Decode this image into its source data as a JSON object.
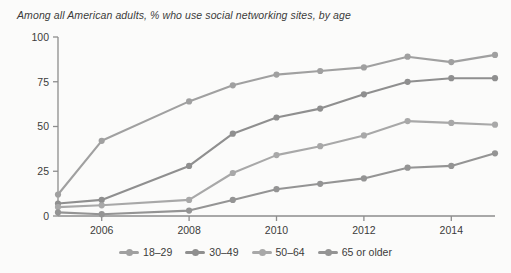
{
  "chart_data": {
    "type": "line",
    "title": "Among all American adults, % who use social networking sites, by age",
    "xlabel": "",
    "ylabel": "",
    "xlim": [
      2005,
      2015
    ],
    "ylim": [
      0,
      100
    ],
    "yticks": [
      0,
      25,
      50,
      75,
      100
    ],
    "ytick_labels": [
      "0",
      "25",
      "50",
      "75",
      "100"
    ],
    "xticks": [
      2006,
      2008,
      2010,
      2012,
      2014
    ],
    "xtick_labels": [
      "2006",
      "2008",
      "2010",
      "2012",
      "2014"
    ],
    "grid": false,
    "legend_position": "bottom",
    "x": [
      2005,
      2006,
      2008,
      2009,
      2010,
      2011,
      2012,
      2013,
      2014,
      2015
    ],
    "series": [
      {
        "name": "18–29",
        "color": "#a0a0a0",
        "values": [
          12,
          42,
          64,
          73,
          79,
          81,
          83,
          89,
          86,
          90
        ]
      },
      {
        "name": "30–49",
        "color": "#8f8f8f",
        "values": [
          7,
          9,
          28,
          46,
          55,
          60,
          68,
          75,
          77,
          77
        ]
      },
      {
        "name": "50–64",
        "color": "#a8a8a8",
        "values": [
          5,
          6,
          9,
          24,
          34,
          39,
          45,
          53,
          52,
          51
        ]
      },
      {
        "name": "65 or older",
        "color": "#949494",
        "values": [
          2,
          1,
          3,
          9,
          15,
          18,
          21,
          27,
          28,
          35
        ]
      }
    ]
  },
  "colors": {
    "axis": "#8d8d8d",
    "text": "#3b3b3b",
    "background": "#fbfbfa"
  }
}
